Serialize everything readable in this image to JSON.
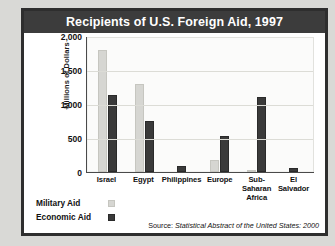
{
  "chart_data": {
    "type": "bar",
    "title": "Recipients of U.S. Foreign Aid, 1997",
    "xlabel": "",
    "ylabel": "Millions of Dollars",
    "ylim": [
      0,
      2000
    ],
    "yticks": [
      2000,
      1500,
      1000,
      500,
      0
    ],
    "ytick_labels": [
      "2,000",
      "1,500",
      "1,000",
      "500",
      "0"
    ],
    "grid": true,
    "legend_position": "bottom-left",
    "categories": [
      "Israel",
      "Egypt",
      "Philippines",
      "Europe",
      "Sub-Saharan Africa",
      "El Salvador"
    ],
    "series": [
      {
        "name": "Military Aid",
        "color": "#d6d6d2",
        "values": [
          1800,
          1300,
          0,
          180,
          30,
          0
        ]
      },
      {
        "name": "Economic Aid",
        "color": "#3a3a3a",
        "values": [
          1130,
          750,
          90,
          530,
          1100,
          55
        ]
      }
    ],
    "source_lead": "Source:",
    "source_cite": "Statistical Abstract of the United States: 2000"
  },
  "legend": [
    {
      "label": "Military Aid",
      "swatch": "mil"
    },
    {
      "label": "Economic Aid",
      "swatch": "eco"
    }
  ],
  "colors": {
    "title_bar": "#3c3c3c",
    "frame": "#2e2e2e",
    "page": "#d9d9d6",
    "military_aid": "#d6d6d2",
    "economic_aid": "#3a3a3a"
  }
}
